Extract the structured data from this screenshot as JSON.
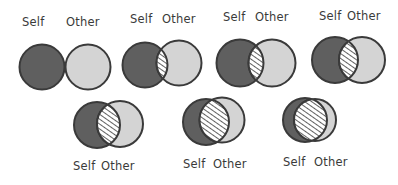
{
  "colors": {
    "self_fill": "#5f5f5f",
    "other_fill": "#d4d4d4",
    "outline": "#3a3a3a",
    "hatch": "#3a3a3a",
    "hatch_bg": "#ffffff"
  },
  "labels": {
    "self": "Self",
    "other": "Other"
  },
  "diagrams": [
    {
      "id": 1,
      "overlap": 0.0
    },
    {
      "id": 2,
      "overlap": 0.12
    },
    {
      "id": 3,
      "overlap": 0.27
    },
    {
      "id": 4,
      "overlap": 0.38
    },
    {
      "id": 5,
      "overlap": 0.5
    },
    {
      "id": 6,
      "overlap": 0.65
    },
    {
      "id": 7,
      "overlap": 0.78
    }
  ]
}
